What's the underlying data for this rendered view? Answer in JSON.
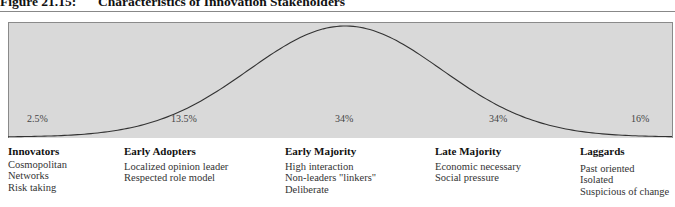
{
  "figure": {
    "number": "Figure 21.15:",
    "title": "Characteristics of Innovation Stakeholders"
  },
  "chart_data": {
    "type": "area",
    "title": "Characteristics of Innovation Stakeholders",
    "segments": [
      {
        "name": "Innovators",
        "share_label": "2.5%",
        "share": 2.5
      },
      {
        "name": "Early Adopters",
        "share_label": "13.5%",
        "share": 13.5
      },
      {
        "name": "Early Majority",
        "share_label": "34%",
        "share": 34
      },
      {
        "name": "Late Majority",
        "share_label": "34%",
        "share": 34
      },
      {
        "name": "Laggards",
        "share_label": "16%",
        "share": 16
      }
    ],
    "xlabel": "",
    "ylabel": "",
    "grid": false
  },
  "categories": [
    {
      "name": "Innovators",
      "pct": "2.5%",
      "traits": [
        "Cosmopolitan",
        "Networks",
        "Risk taking"
      ]
    },
    {
      "name": "Early Adopters",
      "pct": "13.5%",
      "traits": [
        "Localized opinion leader",
        "Respected role model"
      ]
    },
    {
      "name": "Early Majority",
      "pct": "34%",
      "traits": [
        "High interaction",
        "Non-leaders \"linkers\"",
        "Deliberate"
      ]
    },
    {
      "name": "Late Majority",
      "pct": "34%",
      "traits": [
        "Economic necessary",
        "Social pressure"
      ]
    },
    {
      "name": "Laggards",
      "pct": "16%",
      "traits": [
        "Past oriented",
        "Isolated",
        "Suspicious of change"
      ]
    }
  ],
  "colors": {
    "panel": "#d9d9d9",
    "curve": "#333333"
  }
}
